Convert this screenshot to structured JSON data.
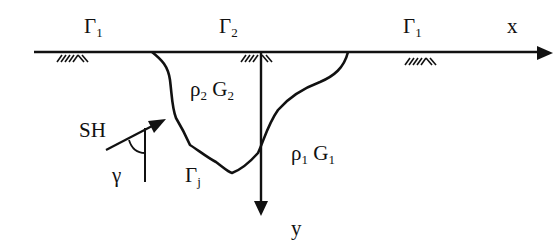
{
  "diagram": {
    "axes": {
      "x_label": "x",
      "y_label": "y"
    },
    "boundaries": [
      {
        "symbol": "Γ",
        "subscript": "1",
        "position": "left"
      },
      {
        "symbol": "Γ",
        "subscript": "2",
        "position": "center"
      },
      {
        "symbol": "Γ",
        "subscript": "1",
        "position": "right"
      },
      {
        "symbol": "Γ",
        "subscript": "j",
        "position": "valley-interface"
      }
    ],
    "regions": {
      "valley": {
        "density": "ρ",
        "density_sub": "2",
        "modulus": "G",
        "modulus_sub": "2"
      },
      "half_space": {
        "density": "ρ",
        "density_sub": "1",
        "modulus": "G",
        "modulus_sub": "1"
      }
    },
    "incident_wave": {
      "label": "SH",
      "angle": "γ"
    },
    "colors": {
      "ink": "#111111",
      "background": "#ffffff"
    }
  }
}
